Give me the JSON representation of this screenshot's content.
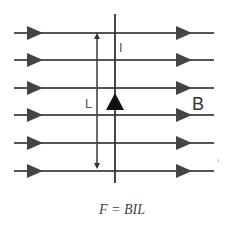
{
  "diagram": {
    "field_lines": {
      "count": 6,
      "y_positions": [
        33,
        60,
        88,
        115,
        143,
        171
      ],
      "x_start": 14,
      "x_end": 214,
      "direction": "right",
      "color": "#555555"
    },
    "wire": {
      "x": 115,
      "y_top": 14,
      "y_bottom": 183,
      "current_direction": "up",
      "color": "#333333"
    },
    "length_marker": {
      "x": 97,
      "y_top": 33,
      "y_bottom": 171,
      "double_headed": true
    },
    "labels": {
      "current": "I",
      "length": "L",
      "field": "B"
    },
    "formula": "F = BIL",
    "colors": {
      "line": "#555555",
      "arrowhead": "#444444",
      "wire_arrow": "#111111",
      "text": "#555555",
      "background": "#ffffff"
    }
  }
}
